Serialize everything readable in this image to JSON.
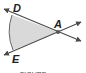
{
  "diagram": {
    "type": "angle-with-sector",
    "vertex": {
      "label": "A",
      "x": 58,
      "y": 32
    },
    "points": [
      {
        "label": "D",
        "x": 17,
        "y": 11
      },
      {
        "label": "E",
        "x": 16,
        "y": 52
      }
    ],
    "lines": [
      {
        "name": "line-AD",
        "from": [
          4,
          9
        ],
        "to": [
          81,
          41
        ],
        "arrows": "both"
      },
      {
        "name": "line-AE",
        "from": [
          4,
          55
        ],
        "to": [
          81,
          22
        ],
        "arrows": "both"
      }
    ],
    "sector": {
      "fill": "#d9d9d9",
      "stroke": "#555555"
    },
    "colors": {
      "line": "#4a4a4a",
      "label": "#222222",
      "vertex": "#555555"
    },
    "labels": {
      "D": "D",
      "A": "A",
      "E": "E"
    },
    "caption": "FIGURE"
  }
}
